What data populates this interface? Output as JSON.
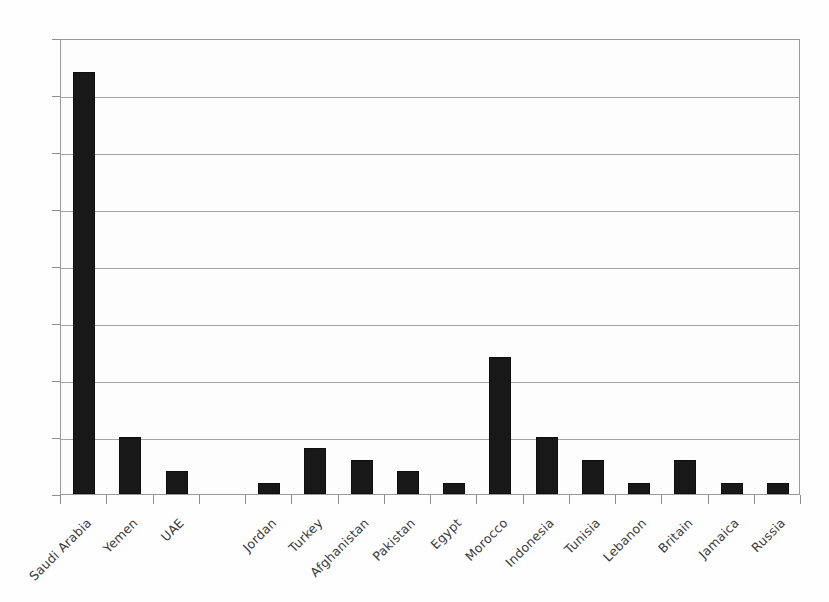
{
  "chart_data": {
    "type": "bar",
    "title": "",
    "subtitle": "",
    "xlabel": "",
    "ylabel": "",
    "ylim": [
      0,
      40
    ],
    "y_ticks": [
      0,
      5,
      10,
      15,
      20,
      25,
      30,
      35,
      40
    ],
    "grid": true,
    "legend": "none",
    "orientation": "vertical",
    "bar_color": "#181818",
    "gridline_color": "#a4a4a4",
    "background_color": "#fdfdfd",
    "axis_color": "#8e8e8e",
    "label_rotation": -45,
    "categories": [
      "Saudi Arabia",
      "Yemen",
      "UAE",
      "",
      "Jordan",
      "Turkey",
      "Afghanistan",
      "Pakistan",
      "Egypt",
      "Morocco",
      "Indonesia",
      "Tunisia",
      "Lebanon",
      "Britain",
      "Jamaica",
      "Russia"
    ],
    "values": [
      37,
      5,
      2,
      0,
      1,
      4,
      3,
      2,
      1,
      12,
      5,
      3,
      1,
      3,
      1,
      1
    ]
  }
}
